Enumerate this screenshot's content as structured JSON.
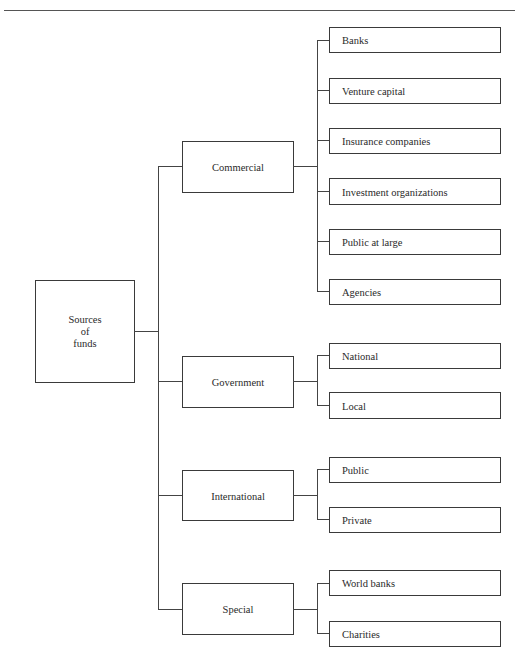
{
  "diagram": {
    "root": {
      "label": "Sources\nof\nfunds",
      "lines": [
        "Sources",
        "of",
        "funds"
      ]
    },
    "branches": [
      {
        "label": "Commercial",
        "children": [
          "Banks",
          "Venture capital",
          "Insurance companies",
          "Investment organizations",
          "Public at large",
          "Agencies"
        ]
      },
      {
        "label": "Government",
        "children": [
          "National",
          "Local"
        ]
      },
      {
        "label": "International",
        "children": [
          "Public",
          "Private"
        ]
      },
      {
        "label": "Special",
        "children": [
          "World banks",
          "Charities"
        ]
      }
    ]
  }
}
